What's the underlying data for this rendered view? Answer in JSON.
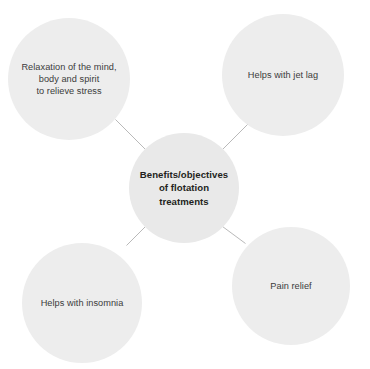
{
  "diagram": {
    "type": "hub-and-spoke",
    "title": "Benefits/objectives of flotation treatments",
    "background_color": "#ffffff",
    "node_fill_color": "#ededed",
    "center_node_fill_color": "#e9e9e9",
    "connector_color": "#b9b9b9",
    "center": {
      "label": "Benefits/objectives\nof flotation\ntreatments",
      "text_color": "#231f20"
    },
    "leaves": [
      {
        "id": "relaxation",
        "label": "Relaxation of the mind,\nbody and spirit\nto relieve stress",
        "position": "top-left"
      },
      {
        "id": "jetlag",
        "label": "Helps with jet lag",
        "position": "top-right"
      },
      {
        "id": "insomnia",
        "label": "Helps with insomnia",
        "position": "bottom-left"
      },
      {
        "id": "pain",
        "label": "Pain relief",
        "position": "bottom-right"
      }
    ],
    "connectors": [
      {
        "from": "center",
        "to": "relaxation"
      },
      {
        "from": "center",
        "to": "jetlag"
      },
      {
        "from": "center",
        "to": "insomnia"
      },
      {
        "from": "center",
        "to": "pain"
      }
    ]
  }
}
